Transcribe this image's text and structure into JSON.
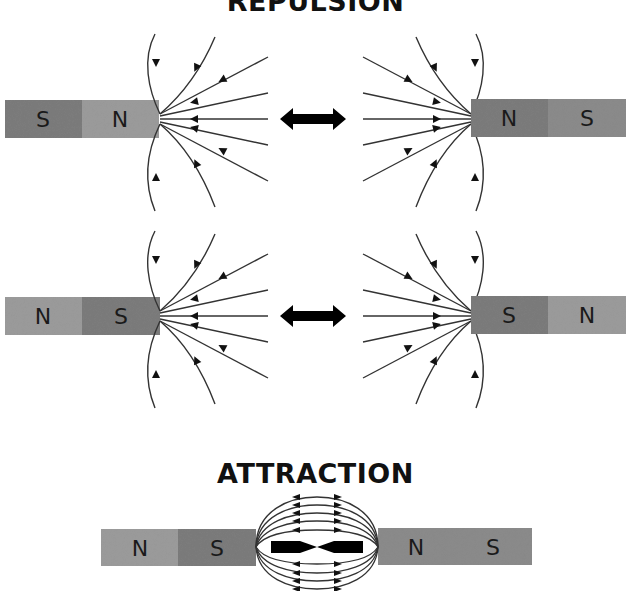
{
  "titles": {
    "repulsion": "REPULSION",
    "attraction": "ATTRACTION"
  },
  "colors": {
    "pole_dark": "#7b7b7b",
    "pole_light": "#9a9a9a",
    "field_line": "#333333",
    "arrow": "#000000"
  },
  "repulsion_row1": {
    "left_magnet": [
      "S",
      "N"
    ],
    "right_magnet": [
      "N",
      "S"
    ],
    "force": "double-arrow"
  },
  "repulsion_row2": {
    "left_magnet": [
      "N",
      "S"
    ],
    "right_magnet": [
      "S",
      "N"
    ],
    "force": "double-arrow"
  },
  "attraction_row": {
    "left_magnet": [
      "N",
      "S"
    ],
    "right_magnet": [
      "N",
      "S"
    ],
    "force": "converging-arrows"
  }
}
